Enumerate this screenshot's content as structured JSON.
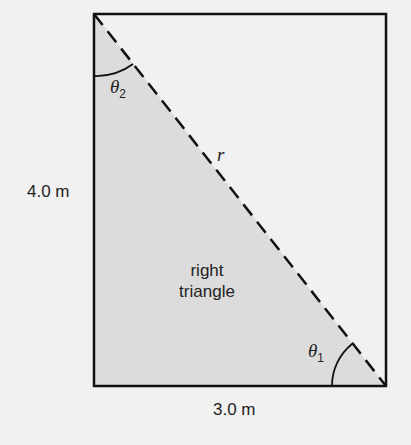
{
  "diagram": {
    "labels": {
      "height": "4.0 m",
      "base": "3.0 m",
      "hypotenuse": "r",
      "region_line1": "right",
      "region_line2": "triangle",
      "angle1_symbol": "θ",
      "angle1_sub": "1",
      "angle2_symbol": "θ",
      "angle2_sub": "2"
    },
    "colors": {
      "background": "#f1f1f1",
      "triangle_fill": "#dcdcdc",
      "stroke": "#111111"
    }
  }
}
